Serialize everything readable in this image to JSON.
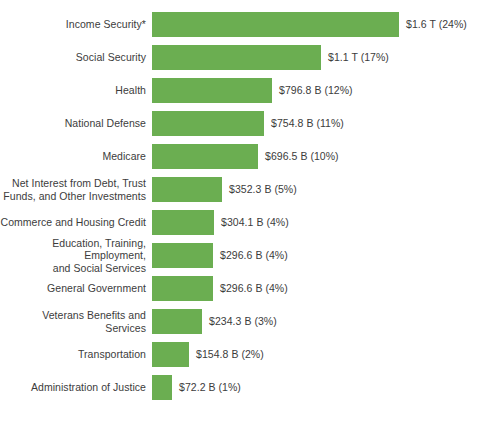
{
  "chart_data": {
    "type": "bar",
    "orientation": "horizontal",
    "title": "",
    "xlabel": "",
    "ylabel": "",
    "grid": false,
    "legend": null,
    "axis_ticks_visible": false,
    "bar_color": "#6bae51",
    "text_color": "#3c3c3c",
    "background": "#ffffff",
    "value_unit": "USD",
    "categories": [
      "Income Security*",
      "Social Security",
      "Health",
      "National Defense",
      "Medicare",
      "Net Interest from Debt, Trust\nFunds, and Other Investments",
      "Commerce and Housing Credit",
      "Education, Training, Employment,\nand Social Services",
      "General Government",
      "Veterans Benefits and Services",
      "Transportation",
      "Administration of Justice"
    ],
    "values": [
      1600,
      1100,
      796.8,
      754.8,
      696.5,
      352.3,
      304.1,
      296.6,
      296.6,
      234.3,
      154.8,
      72.2
    ],
    "value_units": [
      "T",
      "T",
      "B",
      "B",
      "B",
      "B",
      "B",
      "B",
      "B",
      "B",
      "B",
      "B"
    ],
    "percents": [
      24,
      17,
      12,
      11,
      10,
      5,
      4,
      4,
      4,
      3,
      2,
      1
    ],
    "data_labels": [
      "$1.6 T (24%)",
      "$1.1 T (17%)",
      "$796.8 B (12%)",
      "$754.8 B (11%)",
      "$696.5 B (10%)",
      "$352.3 B (5%)",
      "$304.1 B (4%)",
      "$296.6 B (4%)",
      "$296.6 B (4%)",
      "$234.3 B (3%)",
      "$154.8 B (2%)",
      "$72.2 B (1%)"
    ],
    "xlim": [
      0,
      1600
    ],
    "bar_pixel_widths": [
      247,
      169,
      120,
      112,
      106,
      70,
      62,
      61,
      61,
      50,
      37,
      20
    ]
  }
}
